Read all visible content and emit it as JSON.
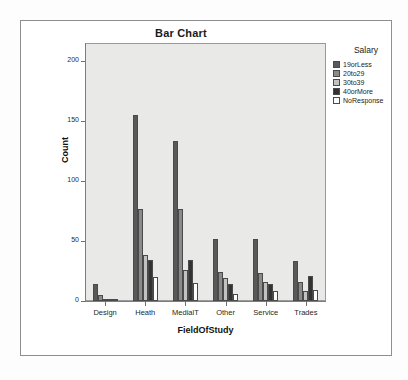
{
  "chart_data": {
    "type": "bar",
    "title": "Bar Chart",
    "xlabel": "FieldOfStudy",
    "ylabel": "Count",
    "ylim": [
      0,
      215
    ],
    "yticks": [
      0,
      50,
      100,
      150,
      200
    ],
    "ytick_labels": [
      "0",
      "50",
      "100",
      "150",
      "200"
    ],
    "grid": false,
    "legend_title": "Salary",
    "legend_position": "right",
    "categories": [
      "Design",
      "Heath",
      "MedialT",
      "Other",
      "Service",
      "Trades"
    ],
    "series": [
      {
        "name": "19orLess",
        "color": "#595959",
        "values": [
          14,
          155,
          133,
          52,
          52,
          33
        ]
      },
      {
        "name": "20to29",
        "color": "#8a8a8a",
        "values": [
          5,
          77,
          77,
          24,
          23,
          16
        ]
      },
      {
        "name": "30to39",
        "color": "#c2c2c2",
        "values": [
          1,
          38,
          26,
          19,
          16,
          8
        ]
      },
      {
        "name": "40orMore",
        "color": "#333333",
        "values": [
          1,
          34,
          34,
          14,
          14,
          21
        ]
      },
      {
        "name": "NoResponse",
        "color": "#ffffff",
        "values": [
          0,
          20,
          15,
          6,
          8,
          9
        ]
      }
    ]
  },
  "colors": {
    "plot_background": "#e9e9e7",
    "page_background": "#ffffff",
    "frame_border": "#8e8e8e",
    "axis": "#7d7d7d",
    "text": "#1a1a1a"
  }
}
